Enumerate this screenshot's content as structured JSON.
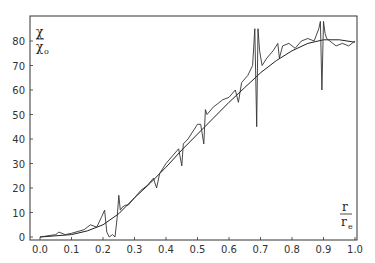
{
  "chart_data": {
    "type": "line",
    "title": "",
    "xlabel": "r / r_e",
    "ylabel": "χ / χ_o",
    "xlabel_parts": {
      "num": "r",
      "den": "r",
      "den_sub": "e"
    },
    "ylabel_parts": {
      "num": "χ",
      "den": "χ",
      "den_sub": "o"
    },
    "xlim": [
      0.0,
      1.0
    ],
    "ylim": [
      0,
      88
    ],
    "x_ticks": [
      "0.0",
      "0.1",
      "0.2",
      "0.3",
      "0.4",
      "0.5",
      "0.6",
      "0.7",
      "0.8",
      "0.9",
      "1.0"
    ],
    "y_ticks": [
      "0",
      "10",
      "20",
      "30",
      "40",
      "50",
      "60",
      "70",
      "80"
    ],
    "grid": false,
    "legend": null,
    "series": [
      {
        "name": "smooth fit",
        "x": [
          0.0,
          0.05,
          0.1,
          0.15,
          0.2,
          0.25,
          0.3,
          0.35,
          0.4,
          0.45,
          0.5,
          0.55,
          0.6,
          0.65,
          0.7,
          0.75,
          0.8,
          0.85,
          0.9,
          0.95,
          1.0
        ],
        "y": [
          0,
          0.5,
          1,
          2.5,
          5,
          9.5,
          16,
          22,
          28.5,
          35.5,
          42,
          48.5,
          55,
          61,
          67,
          72,
          76,
          79,
          80.5,
          80.5,
          79.5
        ]
      },
      {
        "name": "measured (oscillating)",
        "x": [
          0.0,
          0.05,
          0.06,
          0.08,
          0.1,
          0.14,
          0.16,
          0.18,
          0.195,
          0.205,
          0.212,
          0.22,
          0.23,
          0.238,
          0.245,
          0.25,
          0.255,
          0.26,
          0.27,
          0.28,
          0.3,
          0.32,
          0.34,
          0.36,
          0.37,
          0.38,
          0.4,
          0.42,
          0.44,
          0.45,
          0.455,
          0.47,
          0.5,
          0.51,
          0.52,
          0.525,
          0.53,
          0.55,
          0.58,
          0.6,
          0.62,
          0.63,
          0.64,
          0.66,
          0.675,
          0.682,
          0.688,
          0.692,
          0.697,
          0.705,
          0.72,
          0.74,
          0.755,
          0.76,
          0.77,
          0.79,
          0.81,
          0.83,
          0.85,
          0.87,
          0.885,
          0.89,
          0.895,
          0.9,
          0.905,
          0.91,
          0.92,
          0.94,
          0.96,
          0.98,
          1.0
        ],
        "y": [
          0,
          1,
          2,
          1,
          1.5,
          3,
          5,
          4,
          8,
          11,
          2,
          0,
          1,
          0,
          8,
          17,
          11,
          12,
          13,
          13,
          16,
          19,
          21,
          24,
          20,
          26,
          30,
          33,
          36,
          29,
          38,
          40,
          46,
          46,
          38,
          52,
          50,
          53,
          56,
          57,
          60,
          55,
          63,
          66,
          70,
          85,
          45,
          85,
          76,
          70,
          73,
          76,
          79,
          73,
          78,
          79,
          77,
          80,
          81,
          80,
          85,
          88,
          60,
          88,
          83,
          81,
          80,
          78,
          79,
          78,
          80
        ]
      }
    ]
  }
}
